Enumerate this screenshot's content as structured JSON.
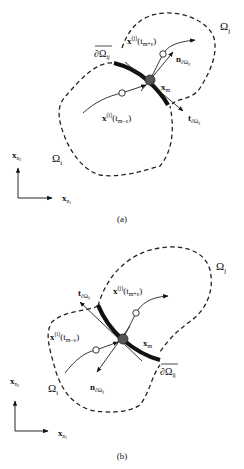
{
  "figure": {
    "panels": [
      {
        "caption": "(a)",
        "labels": {
          "omega_j": "Ω",
          "omega_j_sub": "j",
          "omega_i": "Ω",
          "omega_i_sub": "i",
          "boundary": "∂Ω",
          "boundary_sub": "ij",
          "traj_plus": "x",
          "traj_plus_sup": "(j)",
          "traj_plus_arg": "(t",
          "traj_plus_arg_sub": "m+ε",
          "traj_plus_close": ")",
          "traj_minus": "x",
          "traj_minus_sup": "(i)",
          "traj_minus_arg": "(t",
          "traj_minus_arg_sub": "m−ε",
          "traj_minus_close": ")",
          "point": "x",
          "point_sub": "m",
          "normal": "n",
          "normal_sub": "∂Ω",
          "normal_subsub": "ij",
          "tangent": "t",
          "tangent_sub": "∂Ω",
          "tangent_subsub": "ij",
          "axis_y": "x",
          "axis_y_sub": "n",
          "axis_y_subsub": "2",
          "axis_x": "x",
          "axis_x_sub": "n",
          "axis_x_subsub": "1"
        }
      },
      {
        "caption": "(b)",
        "labels": {
          "omega_j": "Ω",
          "omega_j_sub": "j",
          "omega_i": "Ω",
          "omega_i_sub": "i",
          "boundary": "∂Ω",
          "boundary_sub": "ij",
          "traj_plus": "x",
          "traj_plus_sup": "(j)",
          "traj_plus_arg": "(t",
          "traj_plus_arg_sub": "m+ε",
          "traj_plus_close": ")",
          "traj_minus": "x",
          "traj_minus_sup": "(i)",
          "traj_minus_arg": "(t",
          "traj_minus_arg_sub": "m−ε",
          "traj_minus_close": ")",
          "point": "x",
          "point_sub": "m",
          "normal": "n",
          "normal_sub": "∂Ω",
          "normal_subsub": "ij",
          "tangent": "t",
          "tangent_sub": "∂Ω",
          "tangent_subsub": "ij",
          "axis_y": "x",
          "axis_y_sub": "n",
          "axis_y_subsub": "2",
          "axis_x": "x",
          "axis_x_sub": "n",
          "axis_x_subsub": "1"
        }
      }
    ]
  }
}
